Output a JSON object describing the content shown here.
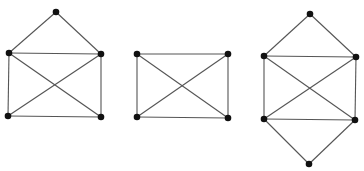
{
  "diagram": {
    "title": "",
    "background": "#ffffff",
    "edge_color": "#555555",
    "vertex_color": "#111111",
    "edge_width": 1.1,
    "vertex_radius": 3.3,
    "graphs": [
      {
        "id": "graph-house-with-x",
        "vertices": [
          {
            "id": "a",
            "x": 56,
            "y": 12
          },
          {
            "id": "b",
            "x": 9,
            "y": 53
          },
          {
            "id": "c",
            "x": 101,
            "y": 54
          },
          {
            "id": "d",
            "x": 8,
            "y": 116
          },
          {
            "id": "e",
            "x": 101,
            "y": 117
          }
        ],
        "edges": [
          [
            "a",
            "b"
          ],
          [
            "a",
            "c"
          ],
          [
            "b",
            "c"
          ],
          [
            "b",
            "d"
          ],
          [
            "c",
            "e"
          ],
          [
            "d",
            "e"
          ],
          [
            "b",
            "e"
          ],
          [
            "c",
            "d"
          ]
        ]
      },
      {
        "id": "graph-rectangle-with-x",
        "vertices": [
          {
            "id": "a",
            "x": 137,
            "y": 54
          },
          {
            "id": "b",
            "x": 228,
            "y": 54
          },
          {
            "id": "c",
            "x": 137,
            "y": 117
          },
          {
            "id": "d",
            "x": 228,
            "y": 118
          }
        ],
        "edges": [
          [
            "a",
            "b"
          ],
          [
            "a",
            "c"
          ],
          [
            "b",
            "d"
          ],
          [
            "c",
            "d"
          ],
          [
            "a",
            "d"
          ],
          [
            "b",
            "c"
          ]
        ]
      },
      {
        "id": "graph-double-house-with-x",
        "vertices": [
          {
            "id": "a",
            "x": 310,
            "y": 14
          },
          {
            "id": "b",
            "x": 264,
            "y": 56
          },
          {
            "id": "c",
            "x": 356,
            "y": 57
          },
          {
            "id": "d",
            "x": 264,
            "y": 119
          },
          {
            "id": "e",
            "x": 355,
            "y": 120
          },
          {
            "id": "f",
            "x": 309,
            "y": 164
          }
        ],
        "edges": [
          [
            "a",
            "b"
          ],
          [
            "a",
            "c"
          ],
          [
            "b",
            "c"
          ],
          [
            "b",
            "d"
          ],
          [
            "c",
            "e"
          ],
          [
            "d",
            "e"
          ],
          [
            "b",
            "e"
          ],
          [
            "c",
            "d"
          ],
          [
            "d",
            "f"
          ],
          [
            "e",
            "f"
          ]
        ]
      }
    ]
  }
}
